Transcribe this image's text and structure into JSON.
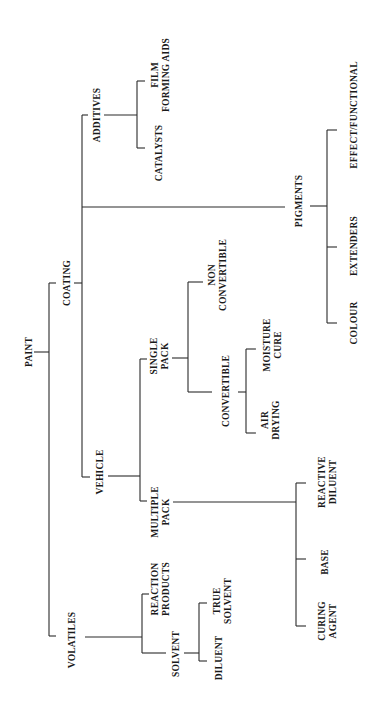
{
  "diagram": {
    "orientation": "rotated 90° counter-clockwise (read with page turned)",
    "root": {
      "label": "PAINT",
      "children": [
        {
          "label": "COATING",
          "children": [
            {
              "label": "ADDITIVES",
              "children": [
                {
                  "label_lines": [
                    "FILM",
                    "FORMING AIDS"
                  ]
                },
                {
                  "label": "CATALYSTS"
                }
              ]
            },
            {
              "label": "PIGMENTS",
              "children": [
                {
                  "label": "EFFECT/FUNCTIONAL"
                },
                {
                  "label": "EXTENDERS"
                },
                {
                  "label": "COLOUR"
                }
              ]
            },
            {
              "label": "VEHICLE",
              "children": [
                {
                  "label_lines": [
                    "SINGLE",
                    "PACK"
                  ],
                  "children": [
                    {
                      "label_lines": [
                        "NON",
                        "CONVERTIBLE"
                      ]
                    },
                    {
                      "label": "CONVERTIBLE",
                      "children": [
                        {
                          "label_lines": [
                            "MOISTURE",
                            "CURE"
                          ]
                        },
                        {
                          "label_lines": [
                            "AIR",
                            "DRYING"
                          ]
                        }
                      ]
                    }
                  ]
                },
                {
                  "label_lines": [
                    "MULTIPLE",
                    "PACK"
                  ],
                  "children": [
                    {
                      "label_lines": [
                        "REACTIVE",
                        "DILUENT"
                      ]
                    },
                    {
                      "label": "BASE"
                    },
                    {
                      "label_lines": [
                        "CURING",
                        "AGENT"
                      ]
                    }
                  ]
                }
              ]
            }
          ]
        },
        {
          "label": "VOLATILES",
          "children": [
            {
              "label_lines": [
                "REACTION",
                "PRODUCTS"
              ]
            },
            {
              "label": "SOLVENT",
              "children": [
                {
                  "label_lines": [
                    "TRUE",
                    "SOLVENT"
                  ]
                },
                {
                  "label": "DILUENT"
                }
              ]
            }
          ]
        }
      ]
    }
  },
  "labels": {
    "paint": "PAINT",
    "coating": "COATING",
    "volatiles": "VOLATILES",
    "additives": "ADDITIVES",
    "film": "FILM",
    "forming_aids": "FORMING AIDS",
    "catalysts": "CATALYSTS",
    "pigments": "PIGMENTS",
    "effect_functional": "EFFECT/FUNCTIONAL",
    "extenders": "EXTENDERS",
    "colour": "COLOUR",
    "vehicle": "VEHICLE",
    "single": "SINGLE",
    "pack": "PACK",
    "non": "NON",
    "convertible": "CONVERTIBLE",
    "moisture": "MOISTURE",
    "cure": "CURE",
    "air": "AIR",
    "drying": "DRYING",
    "multiple": "MULTIPLE",
    "reactive": "REACTIVE",
    "diluent": "DILUENT",
    "base": "BASE",
    "curing": "CURING",
    "agent": "AGENT",
    "reaction": "REACTION",
    "products": "PRODUCTS",
    "solvent": "SOLVENT",
    "true": "TRUE"
  },
  "colors": {
    "background": "#ffffff",
    "line": "#2a2a2a",
    "text": "#1a1a1a"
  }
}
